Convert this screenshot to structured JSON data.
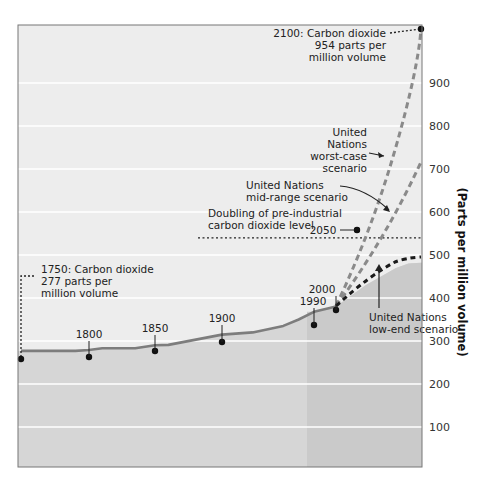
{
  "chart_data": {
    "type": "line",
    "title": "",
    "xlabel": "",
    "ylabel": "(Parts per million volume)",
    "ylim": [
      0,
      1000
    ],
    "yticks": [
      100,
      200,
      300,
      400,
      500,
      600,
      700,
      800,
      900
    ],
    "grid": true,
    "colors": {
      "plot_bg": "#ededed",
      "below_curve": "#d6d6d6",
      "projection_region": "#cacaca",
      "gridline": "#ffffff",
      "historical_line": "#7d7d7d",
      "worst_case": "#8a8a8a",
      "mid_range": "#8a8a8a",
      "low_end": "#1a1a1a",
      "point": "#111111",
      "border": "#777777"
    },
    "series": [
      {
        "name": "Historical CO2",
        "style": "solid",
        "x": [
          1750,
          1790,
          1800,
          1810,
          1835,
          1850,
          1860,
          1900,
          1930,
          1960,
          1975,
          1990,
          2000
        ],
        "values": [
          277,
          277,
          279,
          283,
          283,
          290,
          291,
          315,
          320,
          335,
          350,
          368,
          380
        ]
      },
      {
        "name": "United Nations worst-case scenario",
        "style": "dashed",
        "x": [
          2000,
          2025,
          2050,
          2075,
          2100
        ],
        "values": [
          380,
          480,
          600,
          760,
          954
        ]
      },
      {
        "name": "United Nations mid-range scenario",
        "style": "dashed",
        "x": [
          2000,
          2025,
          2050,
          2075,
          2100
        ],
        "values": [
          380,
          450,
          530,
          620,
          720
        ]
      },
      {
        "name": "United Nations low-end scenario",
        "style": "dashed",
        "x": [
          2000,
          2025,
          2050,
          2075,
          2100
        ],
        "values": [
          380,
          430,
          470,
          480,
          482
        ]
      }
    ],
    "reference_lines": [
      {
        "name": "Doubling of pre-industrial carbon dioxide level",
        "value": 554,
        "style": "dotted"
      }
    ],
    "labeled_points": [
      {
        "year": 1750,
        "label": "1750"
      },
      {
        "year": 1800,
        "label": "1800"
      },
      {
        "year": 1850,
        "label": "1850"
      },
      {
        "year": 1900,
        "label": "1900"
      },
      {
        "year": 1990,
        "label": "1990"
      },
      {
        "year": 2000,
        "label": "2000"
      },
      {
        "year": 2050,
        "label": "2050"
      },
      {
        "year": 2100,
        "label": "2100"
      }
    ],
    "annotations": {
      "start": [
        "1750: Carbon dioxide",
        "277 parts per",
        "million volume"
      ],
      "end": [
        "2100: Carbon dioxide",
        "954 parts per",
        "million volume"
      ],
      "worst_case": [
        "United",
        "Nations",
        "worst-case",
        "scenario"
      ],
      "mid_range": [
        "United Nations",
        "mid-range scenario"
      ],
      "doubling": [
        "Doubling of pre-industrial",
        "carbon dioxide level"
      ],
      "low_end": [
        "United Nations",
        "low-end scenario"
      ]
    }
  }
}
